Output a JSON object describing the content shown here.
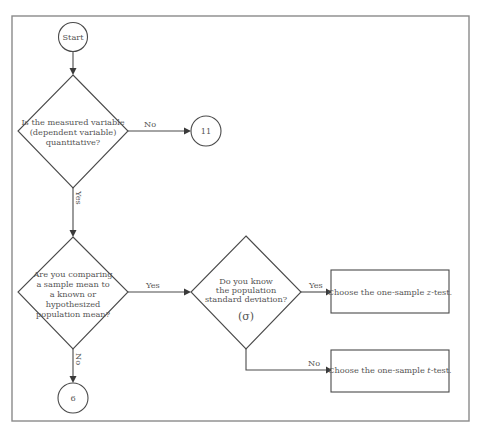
{
  "flowchart": {
    "start": {
      "label": "Start"
    },
    "decision_quantitative": {
      "lines": [
        "Is the measured variable",
        "(dependent variable)",
        "quantitative?"
      ],
      "no_label": "No",
      "yes_label": "Yes"
    },
    "connector_11": {
      "label": "11"
    },
    "decision_compare_mean": {
      "lines": [
        "Are you comparing",
        "a sample mean to",
        "a known or",
        "hypothesized",
        "population mean?"
      ],
      "yes_label": "Yes",
      "no_label": "No"
    },
    "connector_6": {
      "label": "6"
    },
    "decision_know_sigma": {
      "lines": [
        "Do you know",
        "the population",
        "standard deviation?"
      ],
      "symbol": "(σ)",
      "yes_label": "Yes",
      "no_label": "No"
    },
    "result_z": {
      "prefix": "Choose the one-sample ",
      "italic": "z",
      "suffix": "-test."
    },
    "result_t": {
      "prefix": "Choose the one-sample ",
      "italic": "t",
      "suffix": "-test."
    }
  },
  "colors": {
    "frame": "#8a8a8a",
    "stroke": "#4a4a4a",
    "text": "#555555"
  }
}
